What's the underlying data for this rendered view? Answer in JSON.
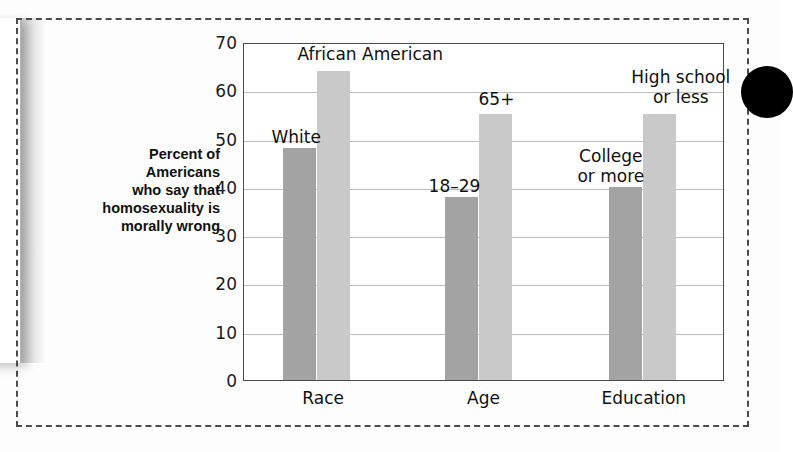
{
  "figure": {
    "y_axis_title": "Percent of\nAmericans\nwho say that\nhomosexuality is\nmorally wrong",
    "black_dot_name": "page-bullet-marker"
  },
  "chart_data": {
    "type": "bar",
    "title": "",
    "subtitle": "",
    "xlabel": "",
    "ylabel": "Percent of Americans who say that homosexuality is morally wrong",
    "ylim": [
      0,
      70
    ],
    "yticks": [
      0,
      10,
      20,
      30,
      40,
      50,
      60,
      70
    ],
    "ytick_labels": [
      "0",
      "10",
      "20",
      "30",
      "40",
      "50",
      "60",
      "70"
    ],
    "grid": true,
    "grid_axis": "y",
    "legend": "none",
    "categories": [
      "Race",
      "Age",
      "Education"
    ],
    "series": [
      {
        "name": "first",
        "color": "#a3a3a3",
        "values": [
          48,
          38,
          40
        ],
        "point_labels": [
          "White",
          "18–29",
          "College\nor more"
        ]
      },
      {
        "name": "second",
        "color": "#c9c9c9",
        "values": [
          64,
          55,
          55
        ],
        "point_labels": [
          "African American",
          "65+",
          "High school\nor less"
        ]
      }
    ],
    "annotations": [
      {
        "text": "White",
        "value": 48,
        "group": "Race"
      },
      {
        "text": "African American",
        "value": 64,
        "group": "Race"
      },
      {
        "text": "18–29",
        "value": 38,
        "group": "Age"
      },
      {
        "text": "65+",
        "value": 55,
        "group": "Age"
      },
      {
        "text": "College\nor more",
        "value": 40,
        "group": "Education"
      },
      {
        "text": "High school\nor less",
        "value": 55,
        "group": "Education"
      }
    ]
  }
}
